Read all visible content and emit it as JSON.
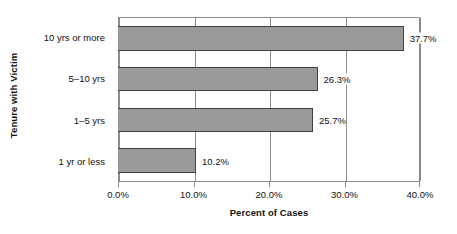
{
  "chart_data": {
    "type": "bar",
    "orientation": "horizontal",
    "title": "",
    "xlabel": "Percent of Cases",
    "ylabel": "Tenure with Victim",
    "categories": [
      "1 yr or less",
      "1–5 yrs",
      "5–10 yrs",
      "10 yrs or more"
    ],
    "values": [
      10.2,
      25.7,
      26.3,
      37.7
    ],
    "value_labels": [
      "10.2%",
      "25.7%",
      "26.3%",
      "37.7%"
    ],
    "xlim": [
      0,
      40
    ],
    "xticks": [
      0,
      10,
      20,
      30,
      40
    ],
    "xtick_labels": [
      "0.0%",
      "10.0%",
      "20.0%",
      "30.0%",
      "40.0%"
    ],
    "grid": "vertical",
    "legend": "none",
    "bar_fill_color": "#9a9a9a",
    "bar_border_color": "#3f3f3f",
    "axis_color": "#8c8c8c",
    "text_color": "#111111",
    "background_color": "#ffffff"
  },
  "axes": {
    "y_title": "Tenure with Victim",
    "x_title": "Percent of Cases"
  }
}
